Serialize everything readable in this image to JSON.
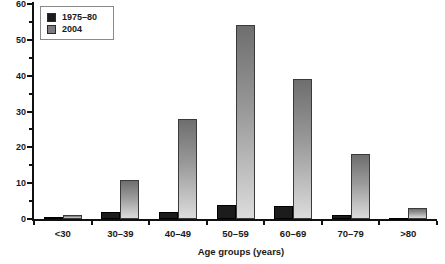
{
  "figure": {
    "background": "#ffffff",
    "xaxis_title": "Age groups (years)"
  },
  "colors": {
    "axis": "#111111",
    "text": "#1a1a1a",
    "series_1975_80": "#1c1c1c",
    "series_2004_top": "#6e6e6e",
    "series_2004_bottom": "#dcdcdc",
    "legend_border": "#8a8a8a"
  },
  "chart_data": {
    "type": "bar",
    "title": "",
    "xlabel": "Age groups (years)",
    "ylabel": "",
    "categories": [
      "<30",
      "30–39",
      "40–49",
      "50–59",
      "60–69",
      "70–79",
      ">80"
    ],
    "series": [
      {
        "name": "1975–80",
        "color": "#1c1c1c",
        "values": [
          0.5,
          2,
          2,
          4,
          3.5,
          1,
          0.3
        ]
      },
      {
        "name": "2004",
        "color": "#7d7d7d",
        "values": [
          1,
          11,
          28,
          54,
          39,
          18,
          3
        ]
      }
    ],
    "ylim": [
      0,
      60
    ],
    "y_major_ticks": [
      0,
      10,
      20,
      30,
      40,
      50,
      60
    ],
    "y_minor_interval": 5,
    "grid": "off",
    "legend_position": "top-left"
  }
}
